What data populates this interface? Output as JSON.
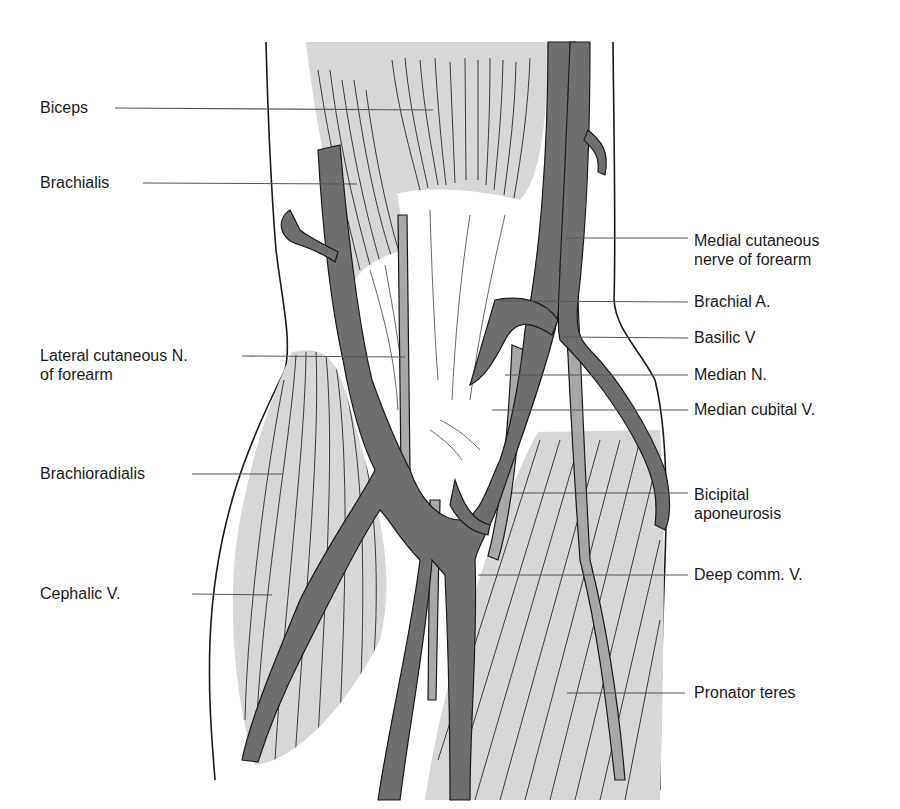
{
  "figure": {
    "colors": {
      "muscle_fill": "#d7d7d7",
      "vein_fill": "#6f6f6f",
      "nerve_artery_fill": "#a8a8a8",
      "outline": "#1a1a1a",
      "leader_line": "#555555",
      "text": "#1a1a1a",
      "background": "#ffffff"
    }
  },
  "labels": {
    "left": [
      {
        "id": "biceps",
        "text": "Biceps"
      },
      {
        "id": "brachialis",
        "text": "Brachialis"
      },
      {
        "id": "lateral_cutaneous",
        "text": "Lateral cutaneous N.\nof forearm"
      },
      {
        "id": "brachioradialis",
        "text": "Brachioradialis"
      },
      {
        "id": "cephalic",
        "text": "Cephalic V."
      }
    ],
    "right": [
      {
        "id": "medial_cutaneous",
        "text": "Medial cutaneous\nnerve of forearm"
      },
      {
        "id": "brachial_a",
        "text": "Brachial A."
      },
      {
        "id": "basilic_v",
        "text": "Basilic V"
      },
      {
        "id": "median_n",
        "text": "Median N."
      },
      {
        "id": "median_cubital",
        "text": "Median cubital V."
      },
      {
        "id": "bicipital_aponeurosis",
        "text": "Bicipital\naponeurosis"
      },
      {
        "id": "deep_comm",
        "text": "Deep comm. V."
      },
      {
        "id": "pronator_teres",
        "text": "Pronator teres"
      }
    ]
  }
}
